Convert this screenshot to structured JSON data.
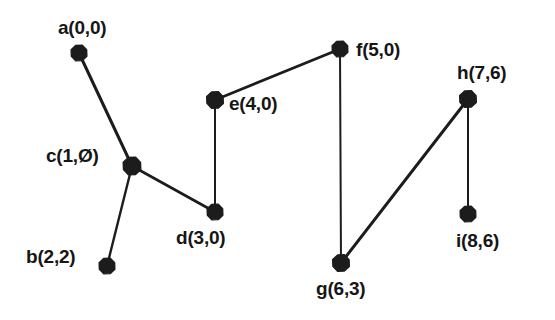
{
  "figure": {
    "kind": "undirected-graph-diagram",
    "background_color": "#ffffff",
    "node_color": "#1c1c1c",
    "edge_color": "#1c1c1c",
    "label_color": "#161616",
    "canvas": {
      "width": 555,
      "height": 320
    }
  },
  "nodes": [
    {
      "id": "a",
      "label": "a(0,0)",
      "x": 79,
      "y": 53,
      "label_x": 58,
      "label_y": 18,
      "r": 8.5
    },
    {
      "id": "b",
      "label": "b(2,2)",
      "x": 107,
      "y": 266,
      "label_x": 26,
      "label_y": 247,
      "r": 8.5
    },
    {
      "id": "c",
      "label": "c(1,Ø)",
      "x": 132,
      "y": 166,
      "label_x": 46,
      "label_y": 146,
      "r": 9.5
    },
    {
      "id": "d",
      "label": "d(3,0)",
      "x": 215,
      "y": 212,
      "label_x": 176,
      "label_y": 228,
      "r": 8.5
    },
    {
      "id": "e",
      "label": "e(4,0)",
      "x": 215,
      "y": 100,
      "label_x": 229,
      "label_y": 94,
      "r": 9.0
    },
    {
      "id": "f",
      "label": "f(5,0)",
      "x": 340,
      "y": 49,
      "label_x": 356,
      "label_y": 40,
      "r": 8.5
    },
    {
      "id": "g",
      "label": "g(6,3)",
      "x": 341,
      "y": 263,
      "label_x": 316,
      "label_y": 279,
      "r": 9.0
    },
    {
      "id": "h",
      "label": "h(7,6)",
      "x": 468,
      "y": 99,
      "label_x": 457,
      "label_y": 63,
      "r": 9.0
    },
    {
      "id": "i",
      "label": "i(8,6)",
      "x": 468,
      "y": 214,
      "label_x": 456,
      "label_y": 231,
      "r": 8.5
    }
  ],
  "edges": [
    {
      "from": "a",
      "to": "c",
      "width": 3.0
    },
    {
      "from": "c",
      "to": "b",
      "width": 2.4
    },
    {
      "from": "c",
      "to": "d",
      "width": 2.6
    },
    {
      "from": "d",
      "to": "e",
      "width": 2.0
    },
    {
      "from": "e",
      "to": "f",
      "width": 2.8
    },
    {
      "from": "f",
      "to": "g",
      "width": 2.0
    },
    {
      "from": "g",
      "to": "h",
      "width": 3.0
    },
    {
      "from": "h",
      "to": "i",
      "width": 2.0
    }
  ],
  "chart_data": {
    "type": "scatter",
    "title": "",
    "xlabel": "",
    "ylabel": "",
    "vertices": [
      {
        "name": "a",
        "coords": [
          0,
          0
        ]
      },
      {
        "name": "b",
        "coords": [
          2,
          2
        ]
      },
      {
        "name": "c",
        "coords": [
          1,
          0
        ]
      },
      {
        "name": "d",
        "coords": [
          3,
          0
        ]
      },
      {
        "name": "e",
        "coords": [
          4,
          0
        ]
      },
      {
        "name": "f",
        "coords": [
          5,
          0
        ]
      },
      {
        "name": "g",
        "coords": [
          6,
          3
        ]
      },
      {
        "name": "h",
        "coords": [
          7,
          6
        ]
      },
      {
        "name": "i",
        "coords": [
          8,
          6
        ]
      }
    ],
    "edge_list": [
      [
        "a",
        "c"
      ],
      [
        "c",
        "b"
      ],
      [
        "c",
        "d"
      ],
      [
        "d",
        "e"
      ],
      [
        "e",
        "f"
      ],
      [
        "f",
        "g"
      ],
      [
        "g",
        "h"
      ],
      [
        "h",
        "i"
      ]
    ],
    "grid": false,
    "legend": "none"
  }
}
